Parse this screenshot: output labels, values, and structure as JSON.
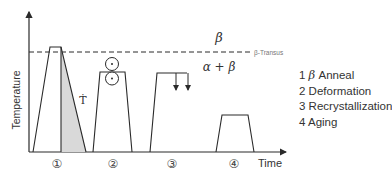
{
  "diagram": {
    "type": "heat-treatment-schedule",
    "y_axis_label": "Temperature",
    "x_axis_label": "Time",
    "transus_label": "β-Transus",
    "phase_above": "β",
    "phase_below": "α + β",
    "cooling_rate_label": "Ṫ",
    "steps": [
      {
        "marker": "①",
        "number": "1",
        "name": "β Anneal"
      },
      {
        "marker": "②",
        "number": "2",
        "name": "Deformation"
      },
      {
        "marker": "③",
        "number": "3",
        "name": "Recrystallization"
      },
      {
        "marker": "④",
        "number": "4",
        "name": "Aging"
      }
    ],
    "legend": [
      {
        "num": "1",
        "greek": "β",
        "text": " Anneal"
      },
      {
        "num": "2",
        "text": "Deformation"
      },
      {
        "num": "3",
        "text": "Recrystallization"
      },
      {
        "num": "4",
        "text": "Aging"
      }
    ],
    "colors": {
      "line": "#2a2a2a",
      "shade": "#d9d9d9",
      "text": "#333333"
    }
  }
}
